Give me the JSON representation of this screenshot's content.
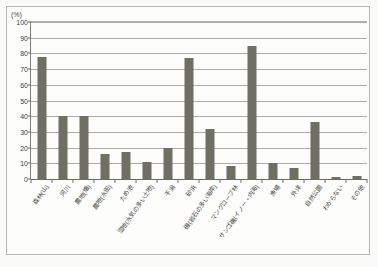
{
  "axis_unit_label": "(%)",
  "caption": "",
  "colors": {
    "bar": "#6f6f64",
    "gridline": "#aeaca4",
    "axis": "#6e6c65",
    "frame": "#b9b7b0",
    "background": "#fdfdfc",
    "text": "#3d3d39"
  },
  "chart_data": {
    "type": "bar",
    "title": "",
    "subtitle": "",
    "xlabel": "",
    "ylabel": "(%)",
    "ylim": [
      0,
      100
    ],
    "ytick_step": 10,
    "yticks": [
      0,
      10,
      20,
      30,
      40,
      50,
      60,
      70,
      80,
      90,
      100
    ],
    "ytick_labels": [
      "0",
      "10",
      "20",
      "30",
      "40",
      "50",
      "60",
      "70",
      "80",
      "90",
      "100"
    ],
    "grid": true,
    "legend": "none",
    "categories": [
      "森林(山)",
      "河川",
      "農地(畑)",
      "農地(水田)",
      "ため池",
      "湿地(水気の多い土地)",
      "干潟",
      "砂浜",
      "磯(岩石の多い海岸)",
      "マングローブ林",
      "サンゴ礁(イノー・内海)",
      "漁場",
      "外洋",
      "自然公園",
      "わからない",
      "その他"
    ],
    "values": [
      78,
      40,
      40,
      16,
      17,
      11,
      20,
      77,
      32,
      8,
      85,
      10,
      7,
      36,
      1,
      2
    ]
  }
}
